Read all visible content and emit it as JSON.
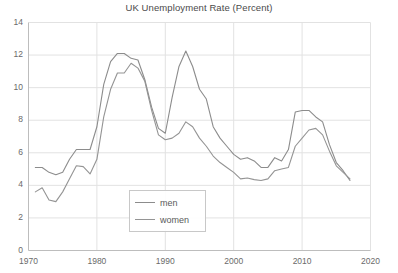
{
  "chart_data": {
    "type": "line",
    "title": "UK Unemployment Rate (Percent)",
    "xlabel": "",
    "ylabel": "",
    "xlim": [
      1970,
      2020
    ],
    "ylim": [
      0,
      14
    ],
    "xticks": [
      1970,
      1980,
      1990,
      2000,
      2010,
      2020
    ],
    "yticks": [
      0,
      2,
      4,
      6,
      8,
      10,
      12,
      14
    ],
    "grid": "both",
    "legend_position": "lower-center",
    "series": [
      {
        "name": "men",
        "color": "#8c8c8c",
        "x": [
          1971,
          1972,
          1973,
          1974,
          1975,
          1976,
          1977,
          1978,
          1979,
          1980,
          1981,
          1982,
          1983,
          1984,
          1985,
          1986,
          1987,
          1988,
          1989,
          1990,
          1991,
          1992,
          1993,
          1994,
          1995,
          1996,
          1997,
          1998,
          1999,
          2000,
          2001,
          2002,
          2003,
          2004,
          2005,
          2006,
          2007,
          2008,
          2009,
          2010,
          2011,
          2012,
          2013,
          2014,
          2015,
          2016,
          2017
        ],
        "values": [
          5.1,
          5.1,
          4.8,
          4.65,
          4.8,
          5.6,
          6.2,
          6.2,
          6.2,
          7.6,
          10.2,
          11.6,
          12.1,
          12.1,
          11.8,
          11.7,
          10.5,
          8.8,
          7.5,
          7.2,
          9.4,
          11.3,
          12.25,
          11.3,
          9.9,
          9.3,
          7.6,
          6.9,
          6.4,
          5.9,
          5.6,
          5.7,
          5.5,
          5.1,
          5.1,
          5.7,
          5.5,
          6.2,
          8.5,
          8.6,
          8.6,
          8.2,
          7.9,
          6.5,
          5.4,
          4.9,
          4.3
        ]
      },
      {
        "name": "women",
        "color": "#949494",
        "x": [
          1971,
          1972,
          1973,
          1974,
          1975,
          1976,
          1977,
          1978,
          1979,
          1980,
          1981,
          1982,
          1983,
          1984,
          1985,
          1986,
          1987,
          1988,
          1989,
          1990,
          1991,
          1992,
          1993,
          1994,
          1995,
          1996,
          1997,
          1998,
          1999,
          2000,
          2001,
          2002,
          2003,
          2004,
          2005,
          2006,
          2007,
          2008,
          2009,
          2010,
          2011,
          2012,
          2013,
          2014,
          2015,
          2016,
          2017
        ],
        "values": [
          3.6,
          3.85,
          3.1,
          3.0,
          3.6,
          4.4,
          5.2,
          5.15,
          4.7,
          5.6,
          8.2,
          9.9,
          10.9,
          10.9,
          11.5,
          11.2,
          10.4,
          8.6,
          7.1,
          6.8,
          6.9,
          7.2,
          7.9,
          7.6,
          6.9,
          6.4,
          5.8,
          5.4,
          5.1,
          4.8,
          4.4,
          4.45,
          4.35,
          4.3,
          4.4,
          4.9,
          5.0,
          5.1,
          6.4,
          6.9,
          7.4,
          7.5,
          7.1,
          6.1,
          5.2,
          4.8,
          4.4
        ]
      }
    ]
  },
  "axis": {
    "y_labels": [
      "14",
      "12",
      "10",
      "8",
      "6",
      "4",
      "2",
      "0"
    ],
    "x_labels": [
      "1970",
      "1980",
      "1990",
      "2000",
      "2010",
      "2020"
    ]
  },
  "legend": {
    "entries": [
      {
        "label": "men"
      },
      {
        "label": "women"
      }
    ]
  },
  "colors": {
    "line": "#8c8c8c",
    "grid": "#e2e2e2",
    "axis": "#bdbdbd",
    "text": "#6a6a6a",
    "title": "#4a4a4a",
    "background": "#ffffff"
  }
}
